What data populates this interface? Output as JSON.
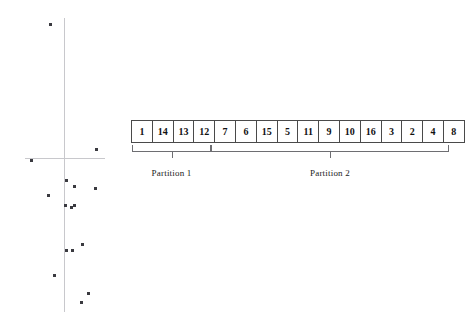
{
  "figure": {
    "title": "",
    "array": {
      "name": "partitioned-array",
      "cells": [
        {
          "value": "1",
          "partition": 1
        },
        {
          "value": "14",
          "partition": 1
        },
        {
          "value": "13",
          "partition": 1
        },
        {
          "value": "12",
          "partition": 1
        },
        {
          "value": "7",
          "partition": 2
        },
        {
          "value": "6",
          "partition": 2
        },
        {
          "value": "15",
          "partition": 2
        },
        {
          "value": "5",
          "partition": 2
        },
        {
          "value": "11",
          "partition": 2
        },
        {
          "value": "9",
          "partition": 2
        },
        {
          "value": "10",
          "partition": 2
        },
        {
          "value": "16",
          "partition": 2
        },
        {
          "value": "3",
          "partition": 2
        },
        {
          "value": "2",
          "partition": 2
        },
        {
          "value": "4",
          "partition": 2
        },
        {
          "value": "8",
          "partition": 2
        }
      ],
      "cell_count": 16,
      "border_color": "#4a4a4a"
    },
    "partitions": [
      {
        "label": "Partition 1",
        "cell_start": 0,
        "cell_end": 3,
        "cell_span": 4
      },
      {
        "label": "Partition 2",
        "cell_start": 4,
        "cell_end": 15,
        "cell_span": 12
      }
    ],
    "scatter": {
      "axis_color": "#c8c8cc",
      "dot_color": "#3a3a40",
      "origin": {
        "x": 64,
        "y": 158
      },
      "v_axis": {
        "x": 64,
        "y_top": 18,
        "y_bottom": 312
      },
      "h_axis": {
        "y": 158,
        "x_left": 25,
        "x_right": 105
      },
      "points": [
        {
          "x": 50,
          "y": 24
        },
        {
          "x": 96,
          "y": 149
        },
        {
          "x": 31,
          "y": 160
        },
        {
          "x": 66,
          "y": 180
        },
        {
          "x": 74,
          "y": 186
        },
        {
          "x": 95,
          "y": 188
        },
        {
          "x": 48,
          "y": 195
        },
        {
          "x": 65,
          "y": 205
        },
        {
          "x": 71,
          "y": 207
        },
        {
          "x": 74,
          "y": 205
        },
        {
          "x": 82,
          "y": 244
        },
        {
          "x": 66,
          "y": 250
        },
        {
          "x": 72,
          "y": 250
        },
        {
          "x": 54,
          "y": 275
        },
        {
          "x": 88,
          "y": 293
        },
        {
          "x": 81,
          "y": 302
        }
      ]
    }
  }
}
